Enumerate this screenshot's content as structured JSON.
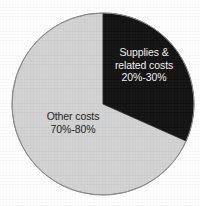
{
  "chart_data": {
    "type": "pie",
    "title": "",
    "subtitle": "",
    "xlabel": "",
    "ylabel": "",
    "legend_position": "none",
    "labels_inside_slices": true,
    "center": {
      "cx": 103,
      "cy": 104,
      "r": 91
    },
    "start_angle_deg": 0,
    "direction": "clockwise",
    "categories": [
      "Supplies & related costs",
      "Other costs"
    ],
    "values": [
      30,
      70
    ],
    "value_ranges": [
      "20%-30%",
      "70%-80%"
    ],
    "colors": [
      "#111111",
      "#d2d2d2"
    ],
    "slices": [
      {
        "name": "Supplies & related costs",
        "label_lines": [
          "Supplies &",
          "related costs",
          "20%-30%"
        ],
        "range_label": "20%-30%",
        "value_min": 20,
        "value_max": 30,
        "value": 30,
        "start_angle_deg": 0,
        "end_angle_deg": 114,
        "fill": "#111111",
        "text_color": "#f2f2f2"
      },
      {
        "name": "Other costs",
        "label_lines": [
          "Other costs",
          "70%-80%"
        ],
        "range_label": "70%-80%",
        "value_min": 70,
        "value_max": 80,
        "value": 70,
        "start_angle_deg": 114,
        "end_angle_deg": 360,
        "fill": "#d2d2d2",
        "text_color": "#1a1a1a"
      }
    ],
    "outline_color": "#8a8a8a",
    "background": "#ffffff"
  },
  "labels": {
    "supplies": {
      "line1": "Supplies &",
      "line2": "related costs",
      "line3": "20%-30%"
    },
    "other": {
      "line1": "Other costs",
      "line2": "70%-80%"
    }
  }
}
